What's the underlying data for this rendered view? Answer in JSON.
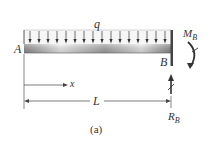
{
  "diagram": {
    "labels": {
      "load": "q",
      "left_end": "A",
      "right_end": "B",
      "moment": "M",
      "moment_sub": "B",
      "reaction": "R",
      "reaction_sub": "B",
      "coordinate": "x",
      "length": "L"
    },
    "caption": "(a)",
    "load_arrow_count": 16,
    "colors": {
      "lines": "#333333",
      "beam_light": "#f2f2f2",
      "beam_dark": "#9a9a9a",
      "load_fill": "#f5f5f5"
    }
  }
}
